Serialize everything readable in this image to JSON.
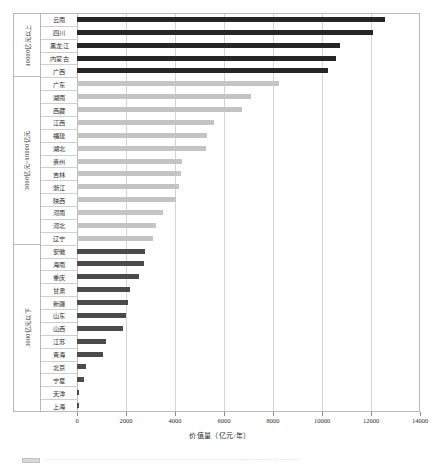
{
  "chart_data": {
    "type": "bar",
    "orientation": "horizontal",
    "title": "",
    "xlabel": "价值量（亿元/年）",
    "ylabel": "",
    "xlim": [
      0,
      14000
    ],
    "xticks": [
      0,
      2000,
      4000,
      6000,
      8000,
      10000,
      12000,
      14000
    ],
    "xticklabels": [
      "0",
      "2000",
      "4000",
      "6000",
      "8000",
      "10000",
      "12000",
      "14000"
    ],
    "grid": true,
    "legend": "none",
    "colors": {
      "group_high": "#262626",
      "group_mid": "#c4c4c4",
      "group_low": "#4b4b4b",
      "gridline": "#d4d4d4",
      "frame": "#b9b9b9"
    },
    "groups": [
      {
        "label": "10000亿元以上",
        "color": "#262626",
        "style": "dark",
        "categories": [
          "云南",
          "四川",
          "黑龙江",
          "内蒙古",
          "广西"
        ],
        "values": [
          12570,
          12080,
          10730,
          10570,
          10250
        ]
      },
      {
        "label": "3000亿元~10000亿元",
        "color": "#c4c4c4",
        "style": "light",
        "categories": [
          "广东",
          "湖南",
          "西藏",
          "江西",
          "福建",
          "湖北",
          "贵州",
          "吉林",
          "浙江",
          "陕西",
          "河南",
          "河北",
          "辽宁"
        ],
        "values": [
          8240,
          7100,
          6730,
          5590,
          5300,
          5260,
          4280,
          4240,
          4160,
          4040,
          3510,
          3220,
          3100
        ]
      },
      {
        "label": "3000亿元以下",
        "color": "#4b4b4b",
        "style": "mid",
        "categories": [
          "安徽",
          "海南",
          "重庆",
          "甘肃",
          "新疆",
          "山东",
          "山西",
          "江苏",
          "青海",
          "北京",
          "宁夏",
          "天津",
          "上海"
        ],
        "values": [
          2780,
          2730,
          2540,
          2180,
          2100,
          1980,
          1880,
          1180,
          1070,
          380,
          290,
          90,
          60
        ]
      }
    ],
    "categories": [
      "云南",
      "四川",
      "黑龙江",
      "内蒙古",
      "广西",
      "广东",
      "湖南",
      "西藏",
      "江西",
      "福建",
      "湖北",
      "贵州",
      "吉林",
      "浙江",
      "陕西",
      "河南",
      "河北",
      "辽宁",
      "安徽",
      "海南",
      "重庆",
      "甘肃",
      "新疆",
      "山东",
      "山西",
      "江苏",
      "青海",
      "北京",
      "宁夏",
      "天津",
      "上海"
    ],
    "values": [
      12570,
      12080,
      10730,
      10570,
      10250,
      8240,
      7100,
      6730,
      5590,
      5300,
      5260,
      4280,
      4240,
      4160,
      4040,
      3510,
      3220,
      3100,
      2780,
      2730,
      2540,
      2180,
      2100,
      1980,
      1880,
      1180,
      1070,
      380,
      290,
      90,
      60
    ]
  },
  "caption": {
    "dots": "·····················································································"
  }
}
